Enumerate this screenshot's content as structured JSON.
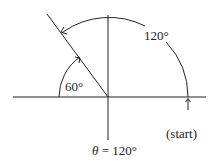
{
  "diagram": {
    "type": "angle-in-standard-position",
    "labels": {
      "big_arc": "120°",
      "small_arc": "60°",
      "start": "(start)",
      "theta_symbol": "θ",
      "theta_eq": " = 120°"
    },
    "angles": {
      "theta_deg": 120,
      "reference_deg": 60
    },
    "colors": {
      "stroke": "#222222",
      "background": "#ffffff"
    }
  }
}
